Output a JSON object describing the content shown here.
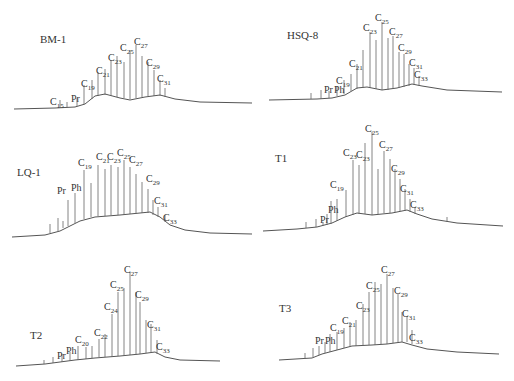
{
  "chart_data": [
    {
      "type": "line",
      "title": "BM-1",
      "subtype": "gas chromatogram",
      "peak_labels": [
        "C15",
        "Pr",
        "C19",
        "C21",
        "C23",
        "C25",
        "C27",
        "C29",
        "C31"
      ],
      "max_peak": "C27",
      "grid": false
    },
    {
      "type": "line",
      "title": "HSQ-8",
      "subtype": "gas chromatogram",
      "peak_labels": [
        "Pr",
        "Ph",
        "C19",
        "C21",
        "C23",
        "C25",
        "C27",
        "C29",
        "C31",
        "C33"
      ],
      "max_peak": "C25",
      "grid": false
    },
    {
      "type": "line",
      "title": "LQ-1",
      "subtype": "gas chromatogram",
      "peak_labels": [
        "Pr",
        "Ph",
        "C19",
        "C21",
        "C23",
        "C25",
        "C27",
        "C29",
        "C31",
        "C33"
      ],
      "max_peak": "C25",
      "grid": false
    },
    {
      "type": "line",
      "title": "T1",
      "subtype": "gas chromatogram",
      "peak_labels": [
        "Pr",
        "Ph",
        "C19",
        "C21",
        "C23",
        "C25",
        "C27",
        "C29",
        "C31",
        "C33"
      ],
      "max_peak": "C25",
      "grid": false
    },
    {
      "type": "line",
      "title": "T2",
      "subtype": "gas chromatogram",
      "peak_labels": [
        "Pr",
        "Ph",
        "C20",
        "C22",
        "C24",
        "C25",
        "C27",
        "C29",
        "C31",
        "C33"
      ],
      "max_peak": "C27",
      "grid": false
    },
    {
      "type": "line",
      "title": "T3",
      "subtype": "gas chromatogram",
      "peak_labels": [
        "Pr",
        "Ph",
        "C19",
        "C21",
        "C23",
        "C25",
        "C27",
        "C29",
        "C31",
        "C33"
      ],
      "max_peak": "C27",
      "grid": false
    }
  ],
  "panels": [
    {
      "name": "BM-1",
      "labels": [
        {
          "t": "C",
          "s": "15",
          "x": 50,
          "y": 97
        },
        {
          "t": "Pr",
          "s": "",
          "x": 71,
          "y": 94
        },
        {
          "t": "C",
          "s": "19",
          "x": 81,
          "y": 79
        },
        {
          "t": "C",
          "s": "21",
          "x": 96,
          "y": 66
        },
        {
          "t": "C",
          "s": "23",
          "x": 108,
          "y": 53
        },
        {
          "t": "C",
          "s": "25",
          "x": 120,
          "y": 43
        },
        {
          "t": "C",
          "s": "27",
          "x": 134,
          "y": 37
        },
        {
          "t": "C",
          "s": "29",
          "x": 146,
          "y": 58
        },
        {
          "t": "C",
          "s": "31",
          "x": 157,
          "y": 74
        }
      ]
    },
    {
      "name": "HSQ-8",
      "labels": [
        {
          "t": "Pr",
          "s": "",
          "x": 67,
          "y": 85
        },
        {
          "t": "Ph",
          "s": "",
          "x": 77,
          "y": 85
        },
        {
          "t": "C",
          "s": "19",
          "x": 79,
          "y": 76
        },
        {
          "t": "C",
          "s": "21",
          "x": 92,
          "y": 59
        },
        {
          "t": "C",
          "s": "23",
          "x": 106,
          "y": 23
        },
        {
          "t": "C",
          "s": "25",
          "x": 118,
          "y": 13
        },
        {
          "t": "C",
          "s": "27",
          "x": 132,
          "y": 27
        },
        {
          "t": "C",
          "s": "29",
          "x": 141,
          "y": 43
        },
        {
          "t": "C",
          "s": "31",
          "x": 152,
          "y": 58
        },
        {
          "t": "C",
          "s": "33",
          "x": 157,
          "y": 70
        }
      ]
    },
    {
      "name": "LQ-1",
      "labels": [
        {
          "t": "Pr",
          "s": "",
          "x": 57,
          "y": 59
        },
        {
          "t": "Ph",
          "s": "",
          "x": 71,
          "y": 56
        },
        {
          "t": "C",
          "s": "19",
          "x": 78,
          "y": 31
        },
        {
          "t": "C",
          "s": "21",
          "x": 96,
          "y": 25
        },
        {
          "t": "C",
          "s": "23",
          "x": 107,
          "y": 25
        },
        {
          "t": "C",
          "s": "25",
          "x": 117,
          "y": 21
        },
        {
          "t": "C",
          "s": "27",
          "x": 129,
          "y": 28
        },
        {
          "t": "C",
          "s": "29",
          "x": 146,
          "y": 47
        },
        {
          "t": "C",
          "s": "31",
          "x": 154,
          "y": 69
        },
        {
          "t": "C",
          "s": "33",
          "x": 163,
          "y": 86
        }
      ]
    },
    {
      "name": "T1",
      "labels": [
        {
          "t": "Pr",
          "s": "",
          "x": 63,
          "y": 88
        },
        {
          "t": "Ph",
          "s": "",
          "x": 71,
          "y": 78
        },
        {
          "t": "C",
          "s": "19",
          "x": 73,
          "y": 53
        },
        {
          "t": "C",
          "s": "23",
          "x": 86,
          "y": 21
        },
        {
          "t": "C",
          "s": "23",
          "x": 99,
          "y": 23
        },
        {
          "t": "C",
          "s": "25",
          "x": 108,
          "y": -3
        },
        {
          "t": "C",
          "s": "27",
          "x": 122,
          "y": 13
        },
        {
          "t": "C",
          "s": "29",
          "x": 134,
          "y": 37
        },
        {
          "t": "C",
          "s": "31",
          "x": 143,
          "y": 57
        },
        {
          "t": "C",
          "s": "33",
          "x": 153,
          "y": 73
        }
      ]
    },
    {
      "name": "T2",
      "labels": [
        {
          "t": "Pr",
          "s": "",
          "x": 57,
          "y": 97
        },
        {
          "t": "Ph",
          "s": "",
          "x": 66,
          "y": 92
        },
        {
          "t": "C",
          "s": "20",
          "x": 75,
          "y": 81
        },
        {
          "t": "C",
          "s": "22",
          "x": 94,
          "y": 74
        },
        {
          "t": "C",
          "s": "24",
          "x": 104,
          "y": 48
        },
        {
          "t": "C",
          "s": "25",
          "x": 110,
          "y": 26
        },
        {
          "t": "C",
          "s": "27",
          "x": 124,
          "y": 11
        },
        {
          "t": "C",
          "s": "29",
          "x": 135,
          "y": 36
        },
        {
          "t": "C",
          "s": "31",
          "x": 147,
          "y": 66
        },
        {
          "t": "C",
          "s": "33",
          "x": 156,
          "y": 88
        }
      ]
    },
    {
      "name": "T3",
      "labels": [
        {
          "t": "Pr",
          "s": "",
          "x": 58,
          "y": 82
        },
        {
          "t": "Ph",
          "s": "",
          "x": 68,
          "y": 82
        },
        {
          "t": "C",
          "s": "19",
          "x": 73,
          "y": 69
        },
        {
          "t": "C",
          "s": "21",
          "x": 85,
          "y": 62
        },
        {
          "t": "C",
          "s": "23",
          "x": 99,
          "y": 47
        },
        {
          "t": "C",
          "s": "25",
          "x": 109,
          "y": 27
        },
        {
          "t": "C",
          "s": "27",
          "x": 124,
          "y": 11
        },
        {
          "t": "C",
          "s": "29",
          "x": 137,
          "y": 32
        },
        {
          "t": "C",
          "s": "31",
          "x": 145,
          "y": 55
        },
        {
          "t": "C",
          "s": "33",
          "x": 152,
          "y": 79
        }
      ]
    }
  ]
}
